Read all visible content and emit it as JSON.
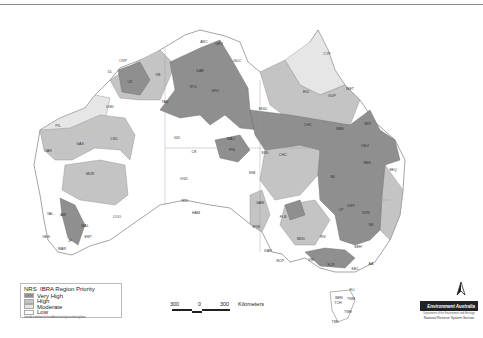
{
  "header": {
    "top_rule": true
  },
  "legend": {
    "title_prefix": "NRS",
    "title": "IBRA Region Priority",
    "classes": [
      {
        "label": "Very High",
        "color": "#8f8f8f"
      },
      {
        "label": "High",
        "color": "#c4c4c4"
      },
      {
        "label": "Moderate",
        "color": "#e6e6e6"
      },
      {
        "label": "Low",
        "color": "#ffffff"
      }
    ],
    "source_path": "/anrdcode/work/nrsdbns/verti/priorities/plots"
  },
  "scale_bar": {
    "left": "300",
    "mid": "0",
    "right": "300",
    "unit": "Kilometers"
  },
  "north_arrow": {
    "glyph": "N"
  },
  "logo": {
    "org": "Environment Australia",
    "dept": "Department of the Environment and Heritage",
    "unit": "National Reserve System Section"
  },
  "map": {
    "colors": {
      "very_high": "#8f8f8f",
      "high": "#c4c4c4",
      "moderate": "#e6e6e6",
      "low": "#ffffff",
      "outline": "#666666",
      "border": "#999999"
    },
    "region_labels": [
      {
        "code": "CK",
        "x": 130,
        "y": 83
      },
      {
        "code": "DL",
        "x": 110,
        "y": 73
      },
      {
        "code": "OVP",
        "x": 123,
        "y": 62
      },
      {
        "code": "VB",
        "x": 158,
        "y": 76
      },
      {
        "code": "DAB",
        "x": 200,
        "y": 72
      },
      {
        "code": "ARC",
        "x": 204,
        "y": 43
      },
      {
        "code": "GFU",
        "x": 219,
        "y": 45
      },
      {
        "code": "STU",
        "x": 193,
        "y": 88
      },
      {
        "code": "GFU",
        "x": 215,
        "y": 92
      },
      {
        "code": "TAN",
        "x": 165,
        "y": 103
      },
      {
        "code": "GUC",
        "x": 237,
        "y": 62
      },
      {
        "code": "CYP",
        "x": 327,
        "y": 55
      },
      {
        "code": "EIU",
        "x": 306,
        "y": 93
      },
      {
        "code": "GUP",
        "x": 332,
        "y": 97
      },
      {
        "code": "WET",
        "x": 350,
        "y": 90
      },
      {
        "code": "MGD",
        "x": 263,
        "y": 110
      },
      {
        "code": "CHC",
        "x": 308,
        "y": 126
      },
      {
        "code": "BBN",
        "x": 340,
        "y": 130
      },
      {
        "code": "BRT",
        "x": 368,
        "y": 125
      },
      {
        "code": "DEU",
        "x": 365,
        "y": 147
      },
      {
        "code": "BBS",
        "x": 367,
        "y": 164
      },
      {
        "code": "SEQ",
        "x": 393,
        "y": 171
      },
      {
        "code": "ML",
        "x": 333,
        "y": 178
      },
      {
        "code": "PIL",
        "x": 58,
        "y": 127
      },
      {
        "code": "GAS",
        "x": 80,
        "y": 145
      },
      {
        "code": "LSD",
        "x": 114,
        "y": 140
      },
      {
        "code": "CAR",
        "x": 48,
        "y": 152
      },
      {
        "code": "MUR",
        "x": 90,
        "y": 175
      },
      {
        "code": "GSD",
        "x": 110,
        "y": 108
      },
      {
        "code": "GID",
        "x": 177,
        "y": 139
      },
      {
        "code": "CR",
        "x": 194,
        "y": 153
      },
      {
        "code": "MAC",
        "x": 231,
        "y": 140
      },
      {
        "code": "FIN",
        "x": 232,
        "y": 151
      },
      {
        "code": "SSD",
        "x": 265,
        "y": 154
      },
      {
        "code": "CHC",
        "x": 283,
        "y": 156
      },
      {
        "code": "GVD",
        "x": 184,
        "y": 180
      },
      {
        "code": "SIM",
        "x": 252,
        "y": 174
      },
      {
        "code": "YAL",
        "x": 50,
        "y": 215
      },
      {
        "code": "AW",
        "x": 63,
        "y": 216
      },
      {
        "code": "GES",
        "x": 46,
        "y": 238
      },
      {
        "code": "COO",
        "x": 117,
        "y": 218
      },
      {
        "code": "MAL",
        "x": 85,
        "y": 227
      },
      {
        "code": "ESP",
        "x": 88,
        "y": 238
      },
      {
        "code": "JF",
        "x": 70,
        "y": 242
      },
      {
        "code": "WAR",
        "x": 62,
        "y": 250
      },
      {
        "code": "NUL",
        "x": 185,
        "y": 202
      },
      {
        "code": "HAM",
        "x": 196,
        "y": 214
      },
      {
        "code": "GAW",
        "x": 260,
        "y": 204
      },
      {
        "code": "FLB",
        "x": 283,
        "y": 218
      },
      {
        "code": "EYB",
        "x": 256,
        "y": 228
      },
      {
        "code": "KAN",
        "x": 268,
        "y": 252
      },
      {
        "code": "MDD",
        "x": 301,
        "y": 240
      },
      {
        "code": "RIV",
        "x": 323,
        "y": 238
      },
      {
        "code": "CP",
        "x": 341,
        "y": 211
      },
      {
        "code": "DRP",
        "x": 351,
        "y": 207
      },
      {
        "code": "NSS",
        "x": 366,
        "y": 214
      },
      {
        "code": "SB",
        "x": 371,
        "y": 226
      },
      {
        "code": "SEH",
        "x": 358,
        "y": 248
      },
      {
        "code": "NCP",
        "x": 280,
        "y": 262
      },
      {
        "code": "VM",
        "x": 311,
        "y": 261
      },
      {
        "code": "SCP",
        "x": 331,
        "y": 266
      },
      {
        "code": "SEC",
        "x": 355,
        "y": 270
      },
      {
        "code": "AA",
        "x": 371,
        "y": 265
      },
      {
        "code": "FLI",
        "x": 352,
        "y": 291
      },
      {
        "code": "TNM",
        "x": 351,
        "y": 300
      },
      {
        "code": "BEN",
        "x": 339,
        "y": 299
      },
      {
        "code": "TCH",
        "x": 338,
        "y": 304
      },
      {
        "code": "TWE",
        "x": 348,
        "y": 313
      },
      {
        "code": "TSE",
        "x": 335,
        "y": 323
      }
    ]
  }
}
